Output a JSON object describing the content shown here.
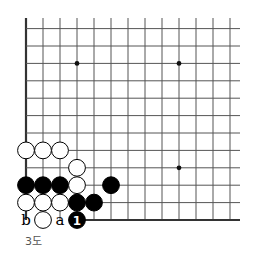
{
  "diagram": {
    "type": "go-board-fragment",
    "caption": "3도",
    "grid": {
      "origin_x": 26,
      "bottom_y": 220,
      "top_y": 18,
      "right_x": 240,
      "spacing_x": 17.0,
      "spacing_y": 17.4,
      "columns": 13,
      "rows": 12,
      "edges": [
        "left",
        "bottom"
      ]
    },
    "star_points": [
      {
        "col": 3,
        "row": 9
      },
      {
        "col": 9,
        "row": 9
      },
      {
        "col": 9,
        "row": 3
      }
    ],
    "stones": [
      {
        "color": "white",
        "col": 0,
        "row": 4
      },
      {
        "color": "white",
        "col": 1,
        "row": 4
      },
      {
        "color": "white",
        "col": 2,
        "row": 4
      },
      {
        "color": "white",
        "col": 3,
        "row": 3
      },
      {
        "color": "black",
        "col": 0,
        "row": 2
      },
      {
        "color": "black",
        "col": 1,
        "row": 2
      },
      {
        "color": "black",
        "col": 2,
        "row": 2
      },
      {
        "color": "white",
        "col": 3,
        "row": 2
      },
      {
        "color": "black",
        "col": 5,
        "row": 2
      },
      {
        "color": "white",
        "col": 0,
        "row": 1
      },
      {
        "color": "white",
        "col": 1,
        "row": 1
      },
      {
        "color": "white",
        "col": 2,
        "row": 1
      },
      {
        "color": "black",
        "col": 3,
        "row": 1
      },
      {
        "color": "black",
        "col": 4,
        "row": 1
      },
      {
        "color": "white",
        "col": 1,
        "row": 0
      },
      {
        "color": "black",
        "col": 3,
        "row": 0,
        "label": "1"
      }
    ],
    "point_labels": [
      {
        "text": "b",
        "col": 0,
        "row": 0
      },
      {
        "text": "a",
        "col": 2,
        "row": 0
      }
    ]
  }
}
